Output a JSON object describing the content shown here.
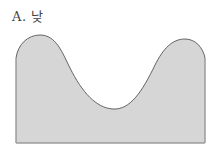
{
  "label": "A. 낮",
  "shape": {
    "fill": "#d6d6d6",
    "stroke": "#555555",
    "description": "cross-section profile with two peaks and a central valley"
  }
}
